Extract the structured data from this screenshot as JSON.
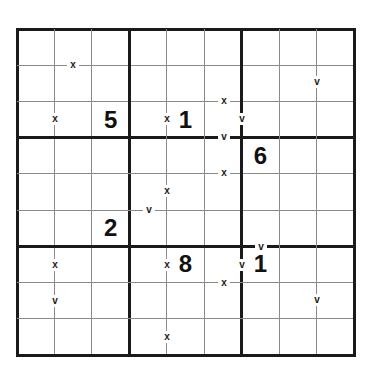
{
  "puzzle": {
    "type": "XV Sudoku",
    "size": 9,
    "grid_left": 17,
    "grid_top": 29,
    "grid_right": 354,
    "grid_bottom": 355,
    "colors": {
      "thick_line": "#1a1a1a",
      "thin_line": "#8a8a8a",
      "digit": "#111111",
      "background": "#ffffff"
    },
    "givens": [
      {
        "row": 2,
        "col": 2,
        "value": "5"
      },
      {
        "row": 2,
        "col": 4,
        "value": "1"
      },
      {
        "row": 3,
        "col": 6,
        "value": "6"
      },
      {
        "row": 5,
        "col": 2,
        "value": "2"
      },
      {
        "row": 6,
        "col": 4,
        "value": "8"
      },
      {
        "row": 6,
        "col": 6,
        "value": "1"
      }
    ],
    "marks": [
      {
        "label": "x",
        "x": 73,
        "y": 65,
        "between": "r0c1-r1c1"
      },
      {
        "label": "x",
        "x": 55,
        "y": 119,
        "between": "r2c0-r2c1"
      },
      {
        "label": "x",
        "x": 167,
        "y": 119,
        "between": "r2c3-r2c4"
      },
      {
        "label": "x",
        "x": 224,
        "y": 101,
        "between": "r1c5-r2c5"
      },
      {
        "label": "v",
        "x": 242,
        "y": 119,
        "between": "r2c5-r2c6"
      },
      {
        "label": "v",
        "x": 224,
        "y": 137,
        "between": "r2c5-r3c5"
      },
      {
        "label": "v",
        "x": 317,
        "y": 82,
        "between": "r1c7-r1c8"
      },
      {
        "label": "x",
        "x": 224,
        "y": 173,
        "between": "r3c5-r4c5"
      },
      {
        "label": "x",
        "x": 167,
        "y": 191,
        "between": "r4c3-r4c4"
      },
      {
        "label": "v",
        "x": 149,
        "y": 210,
        "between": "r4c3-r5c3"
      },
      {
        "label": "v",
        "x": 261,
        "y": 247,
        "between": "r5c6-r6c6"
      },
      {
        "label": "x",
        "x": 55,
        "y": 265,
        "between": "r6c0-r6c1"
      },
      {
        "label": "x",
        "x": 167,
        "y": 265,
        "between": "r6c3-r6c4"
      },
      {
        "label": "v",
        "x": 242,
        "y": 265,
        "between": "r6c5-r6c6"
      },
      {
        "label": "x",
        "x": 224,
        "y": 283,
        "between": "r6c5-r7c5"
      },
      {
        "label": "v",
        "x": 55,
        "y": 301,
        "between": "r7c0-r7c1"
      },
      {
        "label": "v",
        "x": 317,
        "y": 300,
        "between": "r7c7-r7c8"
      },
      {
        "label": "x",
        "x": 167,
        "y": 337,
        "between": "r8c3-r8c4"
      }
    ]
  }
}
